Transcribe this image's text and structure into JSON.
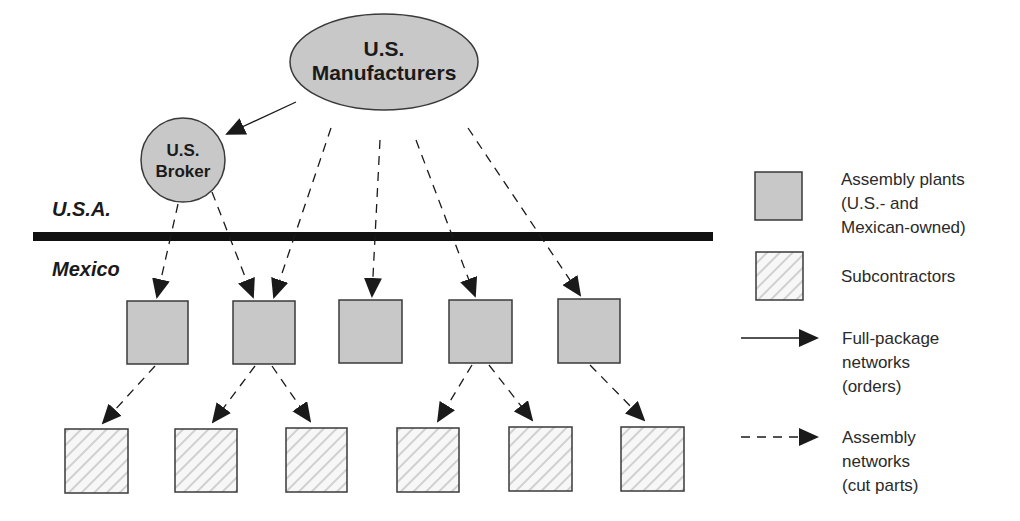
{
  "diagram": {
    "nodes": {
      "manufacturers": {
        "label_lines": [
          "U.S.",
          "Manufacturers"
        ]
      },
      "broker": {
        "label_lines": [
          "U.S.",
          "Broker"
        ]
      }
    },
    "regions": {
      "usa": "U.S.A.",
      "mexico": "Mexico"
    },
    "assembly_plants_count": 5,
    "subcontractors_count": 6,
    "edges": [
      {
        "from": "manufacturers",
        "to": "broker",
        "type": "full-package"
      },
      {
        "from": "broker",
        "to": "plant-1",
        "type": "assembly"
      },
      {
        "from": "broker",
        "to": "plant-2",
        "type": "assembly"
      },
      {
        "from": "manufacturers",
        "to": "plant-2",
        "type": "assembly"
      },
      {
        "from": "manufacturers",
        "to": "plant-3",
        "type": "assembly"
      },
      {
        "from": "manufacturers",
        "to": "plant-4",
        "type": "assembly"
      },
      {
        "from": "manufacturers",
        "to": "plant-5",
        "type": "assembly"
      },
      {
        "from": "plant-1",
        "to": "sub-1",
        "type": "assembly"
      },
      {
        "from": "plant-2",
        "to": "sub-2",
        "type": "assembly"
      },
      {
        "from": "plant-2",
        "to": "sub-3",
        "type": "assembly"
      },
      {
        "from": "plant-4",
        "to": "sub-4",
        "type": "assembly"
      },
      {
        "from": "plant-4",
        "to": "sub-5",
        "type": "assembly"
      },
      {
        "from": "plant-5",
        "to": "sub-6",
        "type": "assembly"
      }
    ],
    "legend": {
      "assembly_plants": [
        "Assembly plants",
        "(U.S.-  and",
        "Mexican-owned)"
      ],
      "subcontractors": [
        "Subcontractors"
      ],
      "full_package": [
        "Full-package",
        "networks",
        "(orders)"
      ],
      "assembly_networks": [
        "Assembly",
        "networks",
        "(cut parts)"
      ]
    },
    "colors": {
      "node_fill": "#c8c8c8",
      "node_stroke": "#3a3a3a",
      "border_line": "#111111",
      "hatch_line": "#d6d6d6",
      "arrow": "#1a1a1a"
    }
  }
}
